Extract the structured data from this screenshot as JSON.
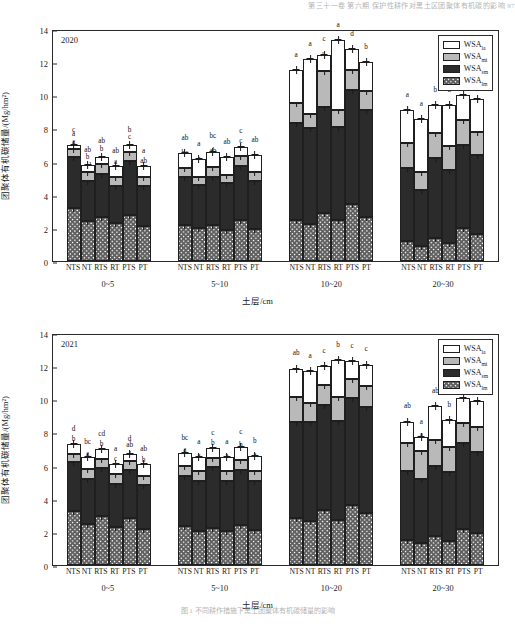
{
  "running_head": "第三十一卷  第六期  保护性耕作对黑土区团聚体有机碳的影响  97",
  "caption": "图 1  不同耕作措施下黑土团聚体有机碳储量的影响",
  "axis": {
    "ylabel": "团聚体有机碳储量/(Mg/hm²)",
    "xlabel": "土层/cm",
    "yticks": [
      "0",
      "2",
      "4",
      "6",
      "8",
      "10",
      "12",
      "14"
    ],
    "ymin": 0,
    "ymax": 14
  },
  "legend": {
    "position": "top-right",
    "items": [
      {
        "label": "WSA",
        "sub": "la",
        "fill": "#ffffff",
        "style": "solid"
      },
      {
        "label": "WSA",
        "sub": "mi",
        "fill": "#b9b9b9",
        "style": "solid"
      },
      {
        "label": "WSA",
        "sub": "sm",
        "fill": "#2b2b2b",
        "style": "solid"
      },
      {
        "label": "WSA",
        "sub": "lm",
        "fill": "#ffffff",
        "style": "hatch"
      }
    ]
  },
  "treatments": [
    "NTS",
    "NT",
    "RTS",
    "RT",
    "PTS",
    "PT"
  ],
  "depths": [
    "0~5",
    "5~10",
    "10~20",
    "20~30"
  ],
  "chart_data": [
    {
      "type": "bar",
      "title": "2020",
      "xlabel": "土层/cm",
      "ylabel": "团聚体有机碳储量/(Mg/hm²)",
      "ylim": [
        0,
        14
      ],
      "grid": false,
      "stacked": true,
      "categories": [
        "0~5",
        "5~10",
        "10~20",
        "20~30"
      ],
      "subcategories": [
        "NTS",
        "NT",
        "RTS",
        "RT",
        "PTS",
        "PT"
      ],
      "series": [
        {
          "name": "WSA_lm",
          "values": [
            [
              3.2,
              2.4,
              2.65,
              2.3,
              2.8,
              2.1
            ],
            [
              2.15,
              2.0,
              2.15,
              1.85,
              2.45,
              1.95
            ],
            [
              2.5,
              2.25,
              2.9,
              2.5,
              3.45,
              2.65
            ],
            [
              1.2,
              0.9,
              1.4,
              1.1,
              2.0,
              1.65
            ]
          ]
        },
        {
          "name": "WSA_sm",
          "values": [
            [
              3.05,
              2.4,
              2.6,
              2.2,
              3.25,
              2.4
            ],
            [
              2.95,
              2.6,
              2.95,
              2.85,
              3.3,
              2.9
            ],
            [
              5.8,
              5.8,
              6.4,
              5.6,
              6.85,
              6.45
            ],
            [
              4.4,
              3.4,
              4.8,
              4.4,
              5.0,
              4.75
            ]
          ]
        },
        {
          "name": "WSA_mi",
          "values": [
            [
              0.5,
              0.55,
              0.6,
              0.55,
              0.5,
              0.6
            ],
            [
              0.5,
              0.5,
              0.6,
              0.5,
              0.6,
              0.55
            ],
            [
              1.25,
              0.85,
              2.15,
              1.0,
              1.25,
              1.15
            ],
            [
              1.55,
              1.05,
              1.55,
              1.45,
              1.5,
              1.4
            ]
          ]
        },
        {
          "name": "WSA_la",
          "values": [
            [
              0.25,
              0.45,
              0.45,
              0.7,
              0.45,
              0.65
            ],
            [
              0.9,
              1.05,
              0.9,
              1.05,
              0.55,
              1.0
            ],
            [
              1.95,
              3.3,
              1.0,
              4.25,
              1.25,
              1.75
            ],
            [
              1.95,
              3.2,
              1.65,
              2.45,
              1.5,
              1.95
            ]
          ]
        }
      ],
      "totals": [
        [
          7.0,
          5.8,
          6.3,
          5.75,
          7.0,
          5.75
        ],
        [
          6.5,
          6.15,
          6.6,
          6.25,
          6.9,
          6.4
        ],
        [
          11.5,
          12.2,
          12.45,
          13.35,
          12.8,
          12.0
        ],
        [
          9.1,
          8.55,
          9.4,
          9.4,
          10.0,
          9.75
        ]
      ],
      "sig_letters": {
        "WSA_lm": [
          [
            "a",
            "c",
            "e",
            "d",
            "n",
            "d"
          ],
          [
            "b",
            "c",
            "b",
            "c",
            "a",
            "c"
          ],
          [
            "cd",
            "d",
            "b",
            "cd",
            "a",
            "bc"
          ],
          [
            "c",
            "d",
            "b",
            "c",
            "a",
            "b"
          ]
        ],
        "WSA_sm": [
          [
            "a",
            "cd",
            "c",
            "d",
            "a",
            "c"
          ],
          [
            "b",
            "ab",
            "b",
            "b",
            "a",
            "b"
          ],
          [
            "c",
            "c",
            "b",
            "c",
            "a",
            "b"
          ],
          [
            "cd",
            "d",
            "bc",
            "d",
            "a",
            "b"
          ]
        ],
        "WSA_mi": [
          [
            "a",
            "b",
            "b",
            "a",
            "c",
            "ab"
          ],
          [
            "bc",
            "ab",
            "ab",
            "a",
            "c",
            "a"
          ],
          [
            "ab",
            "a",
            "b",
            "a",
            "c",
            "bc"
          ],
          [
            "a",
            "b",
            "a",
            "ab",
            "b",
            "b"
          ]
        ],
        "WSA_la": [
          [
            "c",
            "ab",
            "ab",
            "ab",
            "b",
            "a"
          ],
          [
            "ab",
            "a",
            "bc",
            "ab",
            "c",
            "ab"
          ],
          [
            "a",
            "a",
            "c",
            "a",
            "d",
            "b"
          ],
          [
            "a",
            "a",
            "b",
            "a",
            "b",
            "a"
          ]
        ]
      }
    },
    {
      "type": "bar",
      "title": "2021",
      "xlabel": "土层/cm",
      "ylabel": "团聚体有机碳储量/(Mg/hm²)",
      "ylim": [
        0,
        14
      ],
      "grid": false,
      "stacked": true,
      "categories": [
        "0~5",
        "5~10",
        "10~20",
        "20~30"
      ],
      "subcategories": [
        "NTS",
        "NT",
        "RTS",
        "RT",
        "PTS",
        "PT"
      ],
      "series": [
        {
          "name": "WSA_lm",
          "values": [
            [
              3.25,
              2.5,
              2.95,
              2.3,
              2.85,
              2.2
            ],
            [
              2.35,
              2.05,
              2.25,
              2.05,
              2.4,
              2.1
            ],
            [
              2.85,
              2.65,
              3.35,
              2.7,
              3.6,
              3.15
            ],
            [
              1.5,
              1.3,
              1.75,
              1.45,
              2.15,
              1.95
            ]
          ]
        },
        {
          "name": "WSA_sm",
          "values": [
            [
              2.95,
              2.7,
              2.9,
              2.6,
              2.9,
              2.6
            ],
            [
              3.05,
              3.0,
              3.65,
              3.0,
              3.35,
              3.0
            ],
            [
              5.8,
              6.0,
              6.3,
              6.0,
              6.5,
              6.4
            ],
            [
              4.2,
              3.9,
              4.25,
              4.15,
              5.2,
              4.85
            ]
          ]
        },
        {
          "name": "WSA_mi",
          "values": [
            [
              0.5,
              0.6,
              0.55,
              0.6,
              0.55,
              0.6
            ],
            [
              0.6,
              0.6,
              0.55,
              0.6,
              0.6,
              0.6
            ],
            [
              1.5,
              1.1,
              1.2,
              1.45,
              1.15,
              1.25
            ],
            [
              1.65,
              1.7,
              1.55,
              1.5,
              1.2,
              1.5
            ]
          ]
        },
        {
          "name": "WSA_la",
          "values": [
            [
              0.6,
              0.7,
              0.6,
              0.6,
              0.4,
              0.7
            ],
            [
              0.75,
              0.85,
              0.6,
              0.85,
              0.75,
              0.85
            ],
            [
              1.7,
              1.95,
              1.15,
              2.2,
              1.05,
              1.3
            ],
            [
              1.3,
              0.8,
              2.05,
              1.65,
              1.55,
              1.6
            ]
          ]
        }
      ],
      "totals": [
        [
          7.3,
          6.5,
          7.0,
          6.1,
          6.7,
          6.1
        ],
        [
          6.75,
          6.5,
          7.05,
          6.5,
          7.1,
          6.55
        ],
        [
          11.85,
          11.7,
          12.0,
          12.35,
          12.3,
          12.1
        ],
        [
          8.65,
          7.7,
          9.6,
          8.75,
          10.1,
          9.9
        ]
      ],
      "sig_letters": {
        "WSA_lm": [
          [
            "a",
            "c",
            "ab",
            "d",
            "b",
            "d"
          ],
          [
            "b",
            "c",
            "a",
            "c",
            "ab",
            "c"
          ],
          [
            "c",
            "d",
            "ab",
            "cd",
            "a",
            "b"
          ],
          [
            "c",
            "c",
            "b",
            "c",
            "a",
            "b"
          ]
        ],
        "WSA_sm": [
          [
            "a",
            "a",
            "b",
            "bc",
            "ab",
            "c"
          ],
          [
            "b",
            "c",
            "b",
            "bc",
            "b",
            "b"
          ],
          [
            "d",
            "cd",
            "b",
            "c",
            "a",
            "a"
          ],
          [
            "c",
            "d",
            "c",
            "c",
            "a",
            "b"
          ]
        ],
        "WSA_mi": [
          [
            "b",
            "a",
            "b",
            "c",
            "ab",
            "b"
          ],
          [
            "a",
            "a",
            "b",
            "a",
            "b",
            "a"
          ],
          [
            "a",
            "a",
            "b",
            "a",
            "c",
            "b"
          ],
          [
            "a",
            "a",
            "ab",
            "bc",
            "c",
            "bc"
          ]
        ],
        "WSA_la": [
          [
            "d",
            "bc",
            "cd",
            "a",
            "d",
            "ab"
          ],
          [
            "bc",
            "a",
            "c",
            "a",
            "c",
            "b"
          ],
          [
            "ab",
            "a",
            "c",
            "b",
            "c",
            "c"
          ],
          [
            "ab",
            "a",
            "ab",
            "b",
            "c",
            "b"
          ]
        ]
      }
    }
  ]
}
